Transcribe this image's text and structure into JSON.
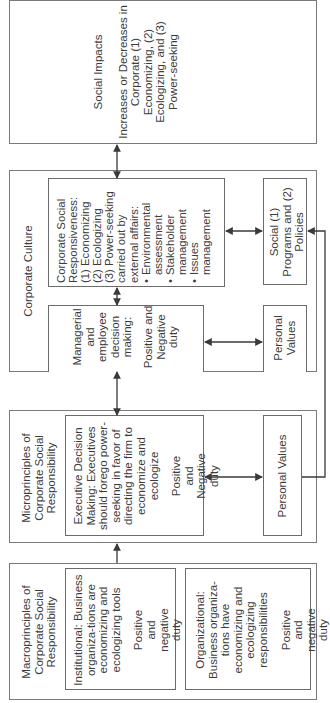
{
  "social_impacts": {
    "title": "Social Impacts",
    "body": "Increases or Decreases in Corporate (1) Economizing, (2) Ecologizing, and (3) Power-seeking"
  },
  "corporate_culture": {
    "title": "Corporate Culture",
    "responsiveness": {
      "line1": "Corporate Social",
      "line2": "Responsiveness:",
      "items": [
        "(1) Economizing",
        "(2) Ecologizing",
        "(3) Power-seeking"
      ],
      "carried": "carried out by",
      "external": "external affairs:",
      "bullets": [
        "Environmental assessment",
        "Stakeholder management",
        "Issues management"
      ]
    },
    "social_programs": "Social (1) Programs and (2) Policies",
    "managerial": {
      "title": "Managerial and employee decision making:",
      "duty": "Positive and Negative duty"
    },
    "personal_values": "Personal Values"
  },
  "microprinciples": {
    "title": "Microprinciples of Corporate Social Responsibility",
    "executive": {
      "body": "Executive Decision Making: Executives should forego power-seeking in favor of directing the firm to economize and ecologize",
      "duty": "Positive and Negative duty"
    },
    "personal_values": "Personal Values"
  },
  "macroprinciples": {
    "title": "Macroprinciples of Corporate Social Responsibility",
    "institutional": {
      "body": "Institutional: Business organiza-tions are economizing and ecologizing tools",
      "duty": "Positive and negative duty"
    },
    "organizational": {
      "body": "Organizational: Business organiza-tions have economizing and ecologizing responsibilities",
      "duty": "Positive and negative duty"
    }
  },
  "colors": {
    "line": "#3a3a3a",
    "border": "#6b6b6b",
    "text": "#3c3c3c"
  }
}
